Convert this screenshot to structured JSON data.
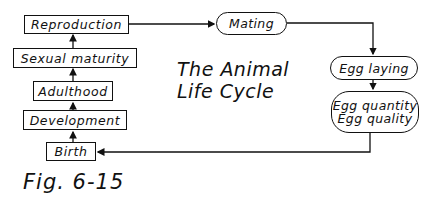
{
  "title": {
    "line1": "The Animal",
    "line2": "Life Cycle"
  },
  "left_column": [
    {
      "label": "Reproduction"
    },
    {
      "label": "Sexual maturity"
    },
    {
      "label": "Adulthood"
    },
    {
      "label": "Development"
    },
    {
      "label": "Birth"
    }
  ],
  "right_nodes": {
    "mating": "Mating",
    "egg_laying": "Egg laying",
    "egg_quantity": "Egg quantity",
    "egg_quality": "Egg quality"
  },
  "caption": "Fig. 6-15",
  "colors": {
    "line": "#111111",
    "background": "#ffffff"
  }
}
